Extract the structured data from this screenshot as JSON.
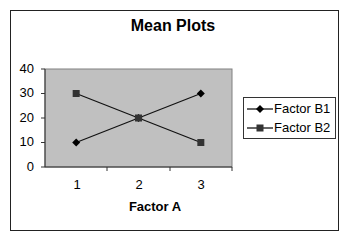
{
  "chart_data": {
    "type": "line",
    "title": "Mean Plots",
    "xlabel": "Factor A",
    "ylabel": "",
    "categories": [
      "1",
      "2",
      "3"
    ],
    "series": [
      {
        "name": "Factor B1",
        "marker": "diamond",
        "values": [
          10,
          20,
          30
        ]
      },
      {
        "name": "Factor B2",
        "marker": "square",
        "values": [
          30,
          20,
          10
        ]
      }
    ],
    "ylim": [
      0,
      40
    ],
    "yticks": [
      "0",
      "10",
      "20",
      "30",
      "40"
    ],
    "grid": false,
    "legend_position": "right",
    "plot_background": "#c0c0c0"
  }
}
